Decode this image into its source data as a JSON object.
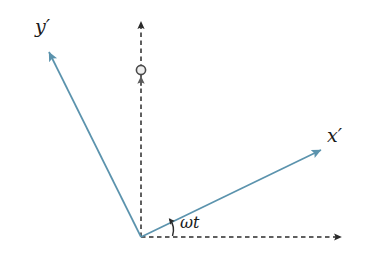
{
  "figure": {
    "type": "vector-diagram",
    "width": 374,
    "height": 263,
    "background_color": "#ffffff"
  },
  "colors": {
    "primed_axis": "#5b93ad",
    "fixed_axis": "#2b2b2b",
    "label_text": "#1a1a1a",
    "marker_outline": "#4a4a4a",
    "marker_fill": "#e8e8e8"
  },
  "labels": {
    "y_prime": "y′",
    "x_prime": "x′",
    "omega_t": "ωt"
  },
  "geometry": {
    "origin": {
      "x": 141,
      "y": 237
    },
    "y_prime_axis": {
      "x1": 141,
      "y1": 237,
      "x2": 47,
      "y2": 48,
      "style": "solid",
      "arrow": "end"
    },
    "x_prime_axis": {
      "x1": 141,
      "y1": 237,
      "x2": 325,
      "y2": 148,
      "style": "solid",
      "arrow": "end"
    },
    "fixed_x_axis": {
      "x1": 141,
      "y1": 237,
      "x2": 345,
      "y2": 237,
      "style": "dashed",
      "arrow": "end"
    },
    "fixed_y_axis": {
      "x1": 141,
      "y1": 237,
      "x2": 141,
      "y2": 18,
      "style": "dashed",
      "arrow": "end"
    },
    "rotation_marker": {
      "cx": 141,
      "cy": 70,
      "r": 4.5,
      "arrow_tip_y": 74,
      "arrow_base_y": 84
    },
    "angle_arc": {
      "cx": 141,
      "cy": 237,
      "radius": 32,
      "start_deg": 0,
      "end_deg": 25.8
    }
  },
  "annotations": {
    "angle_value_deg": 25.8,
    "description": "Primed axes x′ and y′ rotated counter-clockwise by angle omega-t relative to the fixed dashed axes"
  }
}
